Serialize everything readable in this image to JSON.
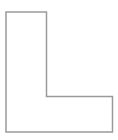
{
  "canvas": {
    "width": 118,
    "height": 140,
    "background_color": "#ffffff"
  },
  "figure": {
    "name": "L-shape",
    "description": "L-shaped polygon outline",
    "fill_color": "#ffffff",
    "stroke_color": "#9a9a9a",
    "stroke_width": 1.5,
    "vertex_count": 6,
    "points": "6,12 46.5,12 46.5,96.5 112.5,96.5 112.5,132 6,132",
    "vertices": [
      {
        "label": "top-left",
        "x": 6,
        "y": 12
      },
      {
        "label": "top-right-of-stem",
        "x": 46.5,
        "y": 12
      },
      {
        "label": "inner-corner",
        "x": 46.5,
        "y": 96.5
      },
      {
        "label": "foot-top-right",
        "x": 112.5,
        "y": 96.5
      },
      {
        "label": "bottom-right",
        "x": 112.5,
        "y": 132
      },
      {
        "label": "bottom-left",
        "x": 6,
        "y": 132
      }
    ]
  }
}
